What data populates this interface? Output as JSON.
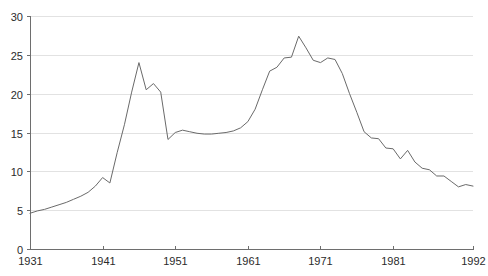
{
  "chart_data": {
    "type": "line",
    "title": "",
    "subtitle": "",
    "xlabel": "",
    "ylabel": "",
    "xlim": [
      1931,
      1992
    ],
    "ylim": [
      0,
      30
    ],
    "grid": true,
    "legend_position": "none",
    "x_ticks": [
      1931,
      1941,
      1951,
      1961,
      1971,
      1981,
      1992
    ],
    "x_tick_labels": [
      "1931",
      "1941",
      "1951",
      "1961",
      "1971",
      "1981",
      "1992"
    ],
    "y_ticks": [
      0,
      5,
      10,
      15,
      20,
      25,
      30
    ],
    "y_tick_labels": [
      "0",
      "5",
      "10",
      "15",
      "20",
      "25",
      "30"
    ],
    "line_color": "#6a6a6a",
    "grid_color": "#e2e2e2",
    "axis_color": "#6e6e6e",
    "background_color": "#ffffff",
    "series": [
      {
        "name": "series-1",
        "x": [
          1931,
          1932,
          1933,
          1934,
          1935,
          1936,
          1937,
          1938,
          1939,
          1940,
          1941,
          1942,
          1943,
          1944,
          1945,
          1946,
          1947,
          1948,
          1949,
          1950,
          1951,
          1952,
          1953,
          1954,
          1955,
          1956,
          1957,
          1958,
          1959,
          1960,
          1961,
          1962,
          1963,
          1964,
          1965,
          1966,
          1967,
          1968,
          1969,
          1970,
          1971,
          1972,
          1973,
          1974,
          1975,
          1976,
          1977,
          1978,
          1979,
          1980,
          1981,
          1982,
          1983,
          1984,
          1985,
          1986,
          1987,
          1988,
          1989,
          1990,
          1991,
          1992
        ],
        "values": [
          4.6,
          4.9,
          5.1,
          5.4,
          5.7,
          6.0,
          6.4,
          6.8,
          7.3,
          8.1,
          9.2,
          8.5,
          12.4,
          16.0,
          20.2,
          24.0,
          20.5,
          21.3,
          20.2,
          14.1,
          15.0,
          15.3,
          15.1,
          14.9,
          14.8,
          14.8,
          14.9,
          15.0,
          15.2,
          15.6,
          16.4,
          18.0,
          20.5,
          22.9,
          23.4,
          24.6,
          24.7,
          27.4,
          25.9,
          24.3,
          24.0,
          24.6,
          24.4,
          22.6,
          20.0,
          17.6,
          15.1,
          14.3,
          14.2,
          13.0,
          12.9,
          11.6,
          12.7,
          11.2,
          10.4,
          10.2,
          9.4,
          9.4,
          8.7,
          8.0,
          8.3,
          8.1
        ]
      }
    ]
  },
  "axes": {
    "x_axis_name": "year-axis",
    "y_axis_name": "value-axis"
  }
}
